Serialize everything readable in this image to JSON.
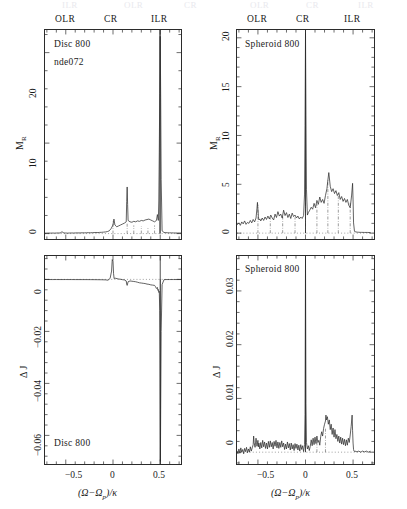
{
  "figure": {
    "width": 407,
    "height": 509,
    "background": "#ffffff",
    "line_color": "#2b2b2b",
    "ghost_row": {
      "olr": "OLR",
      "cr": "CR",
      "ilr": "ILR"
    }
  },
  "resonance_labels": {
    "olr": "OLR",
    "cr": "CR",
    "ilr": "ILR"
  },
  "axis_titles": {
    "x": "(Ω−Ωp)/κ",
    "x_main": "(Ω−Ω",
    "x_sub": "p",
    "x_tail": ")/κ",
    "y_m": "M",
    "y_m_sub": "R",
    "y_dj": "Δ J"
  },
  "chart_data": [
    {
      "id": "top-left",
      "type": "line",
      "title": "",
      "annotations": [
        "Disc 800",
        "nde072"
      ],
      "xlabel": "(Ω−Ωp)/κ",
      "ylabel": "M_R",
      "xlim": [
        -0.72,
        0.72
      ],
      "ylim": [
        -0.6,
        22.5
      ],
      "xticks": [
        -0.5,
        0,
        0.5
      ],
      "xticklabels": [
        "−0.5",
        "0",
        "0.5"
      ],
      "yticks": [
        0,
        10,
        20
      ],
      "yticklabels": [
        "0",
        "10",
        "20"
      ],
      "grid": false,
      "resonances": {
        "OLR": -0.5,
        "CR": 0.0,
        "ILR": 0.5
      },
      "series": [
        {
          "name": "M_R Disc 800",
          "x": [
            -0.72,
            -0.7,
            -0.68,
            -0.66,
            -0.64,
            -0.62,
            -0.6,
            -0.58,
            -0.56,
            -0.54,
            -0.52,
            -0.5,
            -0.48,
            -0.46,
            -0.44,
            -0.42,
            -0.4,
            -0.38,
            -0.36,
            -0.34,
            -0.32,
            -0.3,
            -0.28,
            -0.26,
            -0.24,
            -0.22,
            -0.2,
            -0.18,
            -0.16,
            -0.14,
            -0.12,
            -0.1,
            -0.08,
            -0.06,
            -0.04,
            -0.02,
            0.0,
            0.01,
            0.02,
            0.04,
            0.06,
            0.08,
            0.1,
            0.12,
            0.14,
            0.145,
            0.15,
            0.155,
            0.16,
            0.18,
            0.2,
            0.22,
            0.24,
            0.26,
            0.28,
            0.3,
            0.32,
            0.34,
            0.36,
            0.38,
            0.4,
            0.42,
            0.44,
            0.46,
            0.47,
            0.48,
            0.485,
            0.49,
            0.495,
            0.5,
            0.505,
            0.51,
            0.52,
            0.54,
            0.56,
            0.58,
            0.6,
            0.62,
            0.64,
            0.66,
            0.68,
            0.7,
            0.72
          ],
          "y": [
            0.05,
            0.05,
            0.06,
            0.05,
            0.06,
            0.05,
            0.06,
            0.07,
            0.06,
            0.2,
            0.07,
            0.06,
            0.05,
            0.06,
            0.07,
            0.06,
            0.07,
            0.08,
            0.07,
            0.08,
            0.09,
            0.08,
            0.09,
            0.1,
            0.09,
            0.1,
            0.11,
            0.12,
            0.11,
            0.13,
            0.14,
            0.16,
            0.18,
            0.22,
            0.3,
            0.55,
            0.95,
            1.6,
            0.95,
            0.75,
            0.85,
            0.95,
            1.05,
            1.15,
            1.3,
            3.55,
            5.15,
            3.2,
            1.45,
            1.3,
            1.25,
            1.35,
            1.3,
            1.4,
            1.35,
            1.45,
            1.4,
            1.5,
            1.55,
            1.6,
            1.5,
            1.4,
            1.3,
            1.45,
            2.1,
            1.45,
            3.6,
            9.0,
            15.5,
            21.8,
            15.0,
            6.0,
            0.3,
            0.12,
            0.1,
            0.09,
            0.08,
            0.08,
            0.07,
            0.07,
            0.06,
            0.06,
            0.06
          ]
        }
      ]
    },
    {
      "id": "top-right",
      "type": "line",
      "title": "",
      "annotations": [
        "Spheroid 800"
      ],
      "xlabel": "(Ω−Ωp)/κ",
      "ylabel": "M_R",
      "xlim": [
        -0.72,
        0.72
      ],
      "ylim": [
        -0.6,
        20.8
      ],
      "xticks": [
        -0.5,
        0,
        0.5
      ],
      "xticklabels": [
        "−0.5",
        "0",
        "0.5"
      ],
      "yticks": [
        0,
        5,
        10,
        15,
        20
      ],
      "yticklabels": [
        "0",
        "5",
        "10",
        "15",
        "20"
      ],
      "grid": false,
      "resonances": {
        "OLR": -0.5,
        "CR": 0.0,
        "ILR": 0.5
      },
      "series": [
        {
          "name": "M_R Spheroid 800",
          "x": [
            -0.72,
            -0.7,
            -0.685,
            -0.67,
            -0.655,
            -0.64,
            -0.625,
            -0.61,
            -0.595,
            -0.58,
            -0.565,
            -0.55,
            -0.535,
            -0.52,
            -0.51,
            -0.505,
            -0.5,
            -0.495,
            -0.49,
            -0.48,
            -0.47,
            -0.455,
            -0.44,
            -0.425,
            -0.41,
            -0.395,
            -0.38,
            -0.365,
            -0.35,
            -0.335,
            -0.32,
            -0.305,
            -0.29,
            -0.275,
            -0.26,
            -0.245,
            -0.23,
            -0.215,
            -0.2,
            -0.185,
            -0.17,
            -0.155,
            -0.14,
            -0.125,
            -0.11,
            -0.095,
            -0.08,
            -0.065,
            -0.05,
            -0.035,
            -0.02,
            -0.01,
            -0.005,
            0.0,
            0.005,
            0.01,
            0.02,
            0.03,
            0.045,
            0.06,
            0.075,
            0.09,
            0.105,
            0.12,
            0.135,
            0.15,
            0.165,
            0.18,
            0.195,
            0.21,
            0.225,
            0.235,
            0.245,
            0.26,
            0.275,
            0.29,
            0.305,
            0.32,
            0.335,
            0.35,
            0.365,
            0.38,
            0.395,
            0.41,
            0.425,
            0.44,
            0.455,
            0.47,
            0.485,
            0.495,
            0.5,
            0.505,
            0.515,
            0.53,
            0.545,
            0.56,
            0.575,
            0.59,
            0.62,
            0.65,
            0.68,
            0.72
          ],
          "y": [
            0.85,
            1.05,
            0.8,
            1.15,
            0.95,
            1.25,
            0.9,
            1.1,
            1.0,
            1.3,
            1.05,
            1.4,
            1.15,
            1.55,
            2.55,
            3.15,
            2.4,
            1.7,
            1.35,
            1.45,
            1.25,
            1.55,
            1.3,
            1.65,
            1.4,
            1.75,
            1.45,
            1.85,
            1.55,
            1.35,
            1.95,
            1.6,
            2.2,
            1.75,
            1.95,
            1.55,
            2.35,
            1.8,
            2.1,
            1.6,
            1.95,
            1.5,
            2.05,
            1.7,
            1.85,
            1.55,
            1.75,
            1.45,
            1.65,
            1.5,
            1.8,
            4.0,
            11.0,
            20.5,
            12.0,
            4.5,
            1.85,
            2.1,
            2.35,
            2.65,
            2.45,
            3.05,
            2.6,
            3.35,
            2.95,
            3.7,
            3.15,
            3.45,
            3.05,
            3.85,
            4.55,
            5.4,
            6.2,
            4.8,
            4.25,
            4.55,
            4.05,
            4.35,
            3.85,
            4.15,
            3.45,
            3.75,
            3.25,
            3.55,
            3.15,
            3.45,
            2.85,
            2.6,
            3.9,
            5.1,
            3.4,
            1.05,
            0.18,
            0.12,
            0.1,
            0.09,
            0.08,
            0.08,
            0.07,
            0.07,
            0.06
          ]
        }
      ]
    },
    {
      "id": "bottom-left",
      "type": "line",
      "title": "",
      "annotations": [
        "Disc 800"
      ],
      "xlabel": "(Ω−Ωp)/κ",
      "ylabel": "Δ J",
      "xlim": [
        -0.72,
        0.72
      ],
      "ylim": [
        -0.071,
        0.009
      ],
      "xticks": [
        -0.5,
        0,
        0.5
      ],
      "xticklabels": [
        "−0.5",
        "0",
        "0.5"
      ],
      "yticks": [
        0,
        -0.02,
        -0.04,
        -0.06
      ],
      "yticklabels": [
        "0",
        "−0.02",
        "−0.04",
        "−0.06"
      ],
      "grid": false,
      "resonances": {
        "OLR": -0.5,
        "CR": 0.0,
        "ILR": 0.5
      },
      "series": [
        {
          "name": "ΔJ Disc 800",
          "x": [
            -0.72,
            -0.68,
            -0.64,
            -0.6,
            -0.56,
            -0.52,
            -0.5,
            -0.48,
            -0.44,
            -0.4,
            -0.36,
            -0.32,
            -0.28,
            -0.24,
            -0.2,
            -0.16,
            -0.12,
            -0.08,
            -0.05,
            -0.03,
            -0.015,
            -0.008,
            0.0,
            0.006,
            0.012,
            0.02,
            0.03,
            0.045,
            0.06,
            0.08,
            0.1,
            0.12,
            0.14,
            0.145,
            0.15,
            0.16,
            0.18,
            0.2,
            0.22,
            0.24,
            0.26,
            0.28,
            0.3,
            0.32,
            0.34,
            0.36,
            0.38,
            0.4,
            0.42,
            0.44,
            0.45,
            0.46,
            0.47,
            0.475,
            0.48,
            0.485,
            0.49,
            0.495,
            0.498,
            0.5,
            0.502,
            0.505,
            0.51,
            0.52,
            0.54,
            0.56,
            0.6,
            0.64,
            0.68,
            0.72
          ],
          "y": [
            -5e-05,
            -5e-05,
            -6e-05,
            -5e-05,
            -6e-05,
            -6e-05,
            -5e-05,
            -6e-05,
            -6e-05,
            -7e-05,
            -7e-05,
            -8e-05,
            -8e-05,
            -9e-05,
            -0.0001,
            -0.00012,
            -0.00014,
            -0.00018,
            -0.0003,
            0.0005,
            0.0032,
            0.0076,
            0.007,
            0.0022,
            0.0003,
            0.0005,
            0.0004,
            0.0003,
            0.00015,
            5e-05,
            -0.0001,
            -0.0002,
            -0.0006,
            -0.0018,
            -0.0023,
            -0.0009,
            -0.0006,
            -0.0007,
            -0.0008,
            -0.0009,
            -0.0011,
            -0.0013,
            -0.0014,
            -0.0015,
            -0.0016,
            -0.0018,
            -0.0019,
            -0.0021,
            -0.0022,
            -0.0023,
            -0.0028,
            -0.0035,
            -0.0031,
            -0.0042,
            -0.0039,
            -0.005,
            -0.0046,
            -0.012,
            -0.028,
            -0.052,
            -0.07,
            -0.05,
            -0.02,
            -0.002,
            -0.0001,
            -6e-05,
            -5e-05,
            -5e-05,
            -5e-05,
            -5e-05
          ]
        }
      ]
    },
    {
      "id": "bottom-right",
      "type": "line",
      "title": "",
      "annotations": [
        "Spheroid 800"
      ],
      "xlabel": "(Ω−Ωp)/κ",
      "ylabel": "Δ J",
      "xlim": [
        -0.72,
        0.72
      ],
      "ylim": [
        -0.0022,
        0.0365
      ],
      "xticks": [
        -0.5,
        0,
        0.5
      ],
      "xticklabels": [
        "−0.5",
        "0",
        "0.5"
      ],
      "yticks": [
        0,
        0.01,
        0.02,
        0.03
      ],
      "yticklabels": [
        "0",
        "0.01",
        "0.02",
        "0.03"
      ],
      "grid": false,
      "resonances": {
        "OLR": -0.5,
        "CR": 0.0,
        "ILR": 0.5
      },
      "series": [
        {
          "name": "ΔJ Spheroid 800",
          "x": [
            -0.72,
            -0.71,
            -0.7,
            -0.69,
            -0.68,
            -0.67,
            -0.66,
            -0.65,
            -0.64,
            -0.63,
            -0.62,
            -0.61,
            -0.6,
            -0.59,
            -0.58,
            -0.57,
            -0.56,
            -0.55,
            -0.545,
            -0.54,
            -0.53,
            -0.52,
            -0.515,
            -0.51,
            -0.5,
            -0.495,
            -0.49,
            -0.48,
            -0.47,
            -0.46,
            -0.45,
            -0.44,
            -0.43,
            -0.42,
            -0.41,
            -0.4,
            -0.39,
            -0.38,
            -0.37,
            -0.36,
            -0.35,
            -0.34,
            -0.33,
            -0.32,
            -0.31,
            -0.3,
            -0.29,
            -0.28,
            -0.27,
            -0.26,
            -0.25,
            -0.24,
            -0.23,
            -0.22,
            -0.21,
            -0.2,
            -0.19,
            -0.18,
            -0.17,
            -0.16,
            -0.15,
            -0.14,
            -0.13,
            -0.12,
            -0.11,
            -0.1,
            -0.09,
            -0.08,
            -0.07,
            -0.06,
            -0.05,
            -0.04,
            -0.03,
            -0.02,
            -0.01,
            -0.005,
            0.0,
            0.005,
            0.01,
            0.02,
            0.03,
            0.04,
            0.05,
            0.06,
            0.07,
            0.08,
            0.09,
            0.1,
            0.11,
            0.12,
            0.13,
            0.14,
            0.15,
            0.16,
            0.17,
            0.18,
            0.19,
            0.2,
            0.21,
            0.215,
            0.22,
            0.23,
            0.24,
            0.25,
            0.26,
            0.27,
            0.28,
            0.29,
            0.3,
            0.31,
            0.32,
            0.33,
            0.34,
            0.35,
            0.36,
            0.37,
            0.38,
            0.39,
            0.4,
            0.41,
            0.42,
            0.43,
            0.44,
            0.45,
            0.46,
            0.47,
            0.48,
            0.49,
            0.495,
            0.5,
            0.505,
            0.51,
            0.52,
            0.53,
            0.54,
            0.56,
            0.58,
            0.6,
            0.62,
            0.64,
            0.66,
            0.68,
            0.7,
            0.72
          ],
          "y": [
            0.0002,
            -0.0003,
            0.0006,
            -0.0002,
            0.0008,
            0.0,
            0.0005,
            -0.0003,
            0.0007,
            0.0001,
            0.0009,
            -0.0001,
            0.0006,
            0.0,
            0.001,
            0.0002,
            0.0008,
            0.0014,
            0.003,
            0.0018,
            0.0009,
            0.0026,
            0.0018,
            0.0011,
            0.0022,
            0.001,
            0.0017,
            0.0006,
            0.0018,
            0.0008,
            0.0022,
            0.001,
            0.0019,
            0.0007,
            0.0017,
            0.0006,
            0.002,
            0.0009,
            0.0021,
            0.001,
            0.0018,
            0.0006,
            0.002,
            0.0011,
            0.0022,
            0.0008,
            0.0019,
            0.0007,
            0.0018,
            0.0009,
            0.0021,
            0.001,
            0.0017,
            0.0005,
            0.0015,
            0.0006,
            0.0019,
            0.0008,
            0.0016,
            0.0004,
            0.0017,
            0.0006,
            0.0014,
            0.0003,
            0.0016,
            0.0007,
            0.0015,
            0.0004,
            0.0013,
            0.0002,
            0.0014,
            0.0005,
            0.0012,
            0.0001,
            0.0014,
            0.007,
            0.036,
            0.009,
            0.0018,
            0.0006,
            0.0012,
            0.0003,
            0.0011,
            0.0023,
            0.0012,
            0.0026,
            0.0014,
            0.0028,
            0.0016,
            0.003,
            0.0018,
            0.0022,
            0.0013,
            0.0029,
            0.0038,
            0.003,
            0.0044,
            0.0052,
            0.0058,
            0.0069,
            0.006,
            0.0066,
            0.0052,
            0.006,
            0.0042,
            0.0052,
            0.0033,
            0.0045,
            0.0028,
            0.0042,
            0.0025,
            0.0033,
            0.002,
            0.003,
            0.0017,
            0.0028,
            0.0015,
            0.0026,
            0.0014,
            0.0024,
            0.0012,
            0.0023,
            0.0013,
            0.0026,
            0.0018,
            0.0032,
            0.0048,
            0.0069,
            0.004,
            0.0017,
            0.0005,
            0.0002,
            0.0001,
            0.0002,
            5e-05,
            0.0002,
            0.0,
            0.0002,
            5e-05,
            0.0002,
            0.0,
            0.00015
          ]
        }
      ]
    }
  ]
}
